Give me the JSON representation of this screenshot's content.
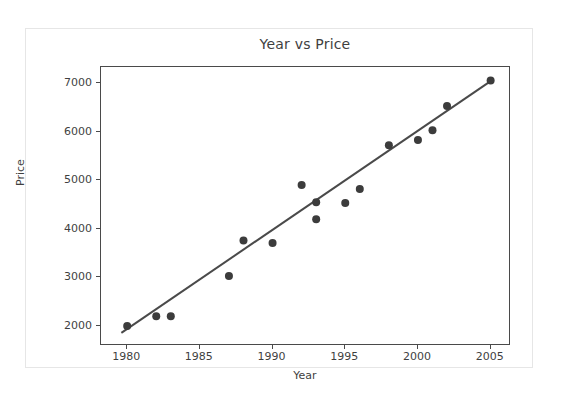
{
  "figure": {
    "title": "Year vs Price",
    "background_color": "#ffffff",
    "border_color": "#e6e6e6"
  },
  "axes": {
    "x_label": "Year",
    "y_label": "Price",
    "x_ticks": [
      "1980",
      "1985",
      "1990",
      "1995",
      "2000",
      "2005"
    ],
    "y_ticks": [
      "2000",
      "3000",
      "4000",
      "5000",
      "6000",
      "7000"
    ],
    "axis_color": "#4a4a4a"
  },
  "chart_data": {
    "type": "scatter",
    "title": "Year vs Price",
    "xlabel": "Year",
    "ylabel": "Price",
    "xlim": [
      1978.2,
      2006.4
    ],
    "ylim": [
      1590,
      7330
    ],
    "grid": false,
    "legend": null,
    "marker_color": "#3c3c3c",
    "marker_size": 7,
    "x": [
      1980,
      1982,
      1983,
      1987,
      1988,
      1990,
      1992,
      1993,
      1993,
      1995,
      1996,
      1998,
      2000,
      2001,
      2002,
      2005
    ],
    "y": [
      2000,
      2200,
      2200,
      3030,
      3760,
      3710,
      4900,
      4550,
      4200,
      4530,
      4820,
      5720,
      5830,
      6030,
      6530,
      7050
    ],
    "points": [
      {
        "x": 1980,
        "y": 2000
      },
      {
        "x": 1982,
        "y": 2200
      },
      {
        "x": 1983,
        "y": 2200
      },
      {
        "x": 1987,
        "y": 3030
      },
      {
        "x": 1988,
        "y": 3760
      },
      {
        "x": 1990,
        "y": 3710
      },
      {
        "x": 1992,
        "y": 4900
      },
      {
        "x": 1993,
        "y": 4550
      },
      {
        "x": 1993,
        "y": 4200
      },
      {
        "x": 1995,
        "y": 4530
      },
      {
        "x": 1996,
        "y": 4820
      },
      {
        "x": 1998,
        "y": 5720
      },
      {
        "x": 2000,
        "y": 5830
      },
      {
        "x": 2001,
        "y": 6030
      },
      {
        "x": 2002,
        "y": 6530
      },
      {
        "x": 2005,
        "y": 7050
      }
    ],
    "trendline": {
      "name": "regression-line",
      "color": "#4a4a4a",
      "width": 2,
      "x_start": 1979.6,
      "y_start": 1860,
      "x_end": 2005.0,
      "y_end": 7040
    }
  }
}
